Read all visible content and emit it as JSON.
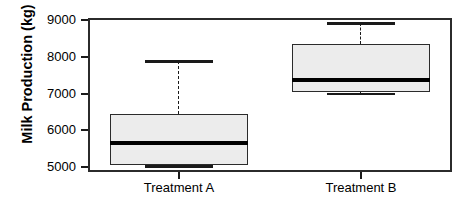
{
  "chart_data": {
    "type": "box",
    "title": "",
    "xlabel": "",
    "ylabel": "Milk Production (kg)",
    "ylim": [
      4870,
      9060
    ],
    "yticks": [
      5000,
      6000,
      7000,
      8000,
      9000
    ],
    "ytick_labels": [
      "5000",
      "6000",
      "7000",
      "8000",
      "9000"
    ],
    "grid": false,
    "legend": false,
    "categories": [
      "Treatment A",
      "Treatment B"
    ],
    "boxes": [
      {
        "label": "Treatment A",
        "whisker_low": 5020,
        "q1": 5070,
        "median": 5650,
        "q3": 6440,
        "whisker_high": 7880,
        "outliers": []
      },
      {
        "label": "Treatment B",
        "whisker_low": 7000,
        "q1": 7050,
        "median": 7380,
        "q3": 8340,
        "whisker_high": 8920,
        "outliers": []
      }
    ],
    "colors": {
      "box_fill": "#ececec",
      "box_edge": "#2b2b2b",
      "median": "#000000",
      "whisker": "#1a1a1a",
      "axis": "#2b2b2b",
      "background": "#ffffff"
    }
  }
}
